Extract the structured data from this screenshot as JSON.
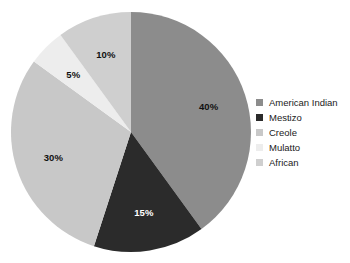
{
  "chart_data": {
    "type": "pie",
    "title": "",
    "subtitle": "",
    "xlabel": "",
    "ylabel": "",
    "grid": false,
    "legend_position": "right",
    "start_angle_deg": 90,
    "direction": "clockwise",
    "categories": [
      "American Indian",
      "Mestizo",
      "Creole",
      "Mulatto",
      "African"
    ],
    "values": [
      40,
      15,
      30,
      5,
      10
    ],
    "value_labels": [
      "40%",
      "15%",
      "30%",
      "5%",
      "10%"
    ],
    "colors": [
      "#8c8c8c",
      "#2b2b2b",
      "#c8c8c8",
      "#ededed",
      "#cfcfcf"
    ],
    "label_colors": [
      "#111111",
      "#ffffff",
      "#111111",
      "#111111",
      "#111111"
    ],
    "slices": [
      {
        "name": "American Indian",
        "value": 40,
        "label": "40%",
        "color": "#8c8c8c",
        "label_color": "#111111"
      },
      {
        "name": "Mestizo",
        "value": 15,
        "label": "15%",
        "color": "#2b2b2b",
        "label_color": "#ffffff"
      },
      {
        "name": "Creole",
        "value": 30,
        "label": "30%",
        "color": "#c8c8c8",
        "label_color": "#111111"
      },
      {
        "name": "Mulatto",
        "value": 5,
        "label": "5%",
        "color": "#ededed",
        "label_color": "#111111"
      },
      {
        "name": "African",
        "value": 10,
        "label": "10%",
        "color": "#cfcfcf",
        "label_color": "#111111"
      }
    ]
  },
  "legend": {
    "items": [
      {
        "label": "American Indian",
        "color": "#8c8c8c"
      },
      {
        "label": "Mestizo",
        "color": "#2b2b2b"
      },
      {
        "label": "Creole",
        "color": "#c8c8c8"
      },
      {
        "label": "Mulatto",
        "color": "#ededed"
      },
      {
        "label": "African",
        "color": "#cfcfcf"
      }
    ]
  },
  "geometry": {
    "center_x": 131,
    "center_y": 132,
    "radius": 120,
    "label_radius_factor": 0.68
  },
  "background": "#ffffff"
}
